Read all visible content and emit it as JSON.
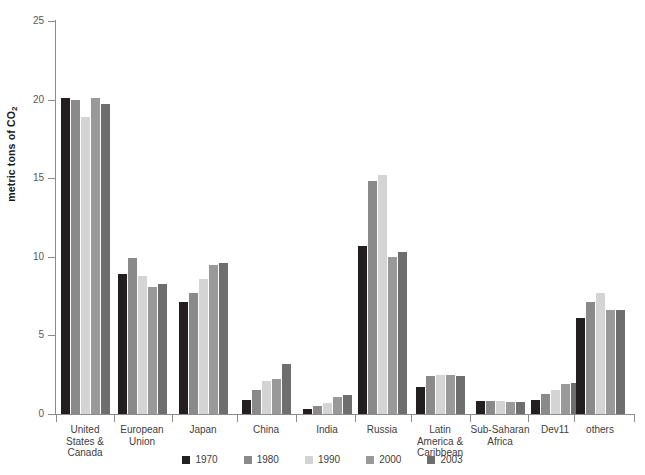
{
  "chart_data": {
    "type": "bar",
    "title": "",
    "subtitle": "",
    "xlabel": "",
    "ylabel": "metric tons of CO2",
    "ylabel_display": "metric tons of CO",
    "ylabel_subscript": "2",
    "ylim": [
      0,
      25
    ],
    "ytick_labels": [
      "0",
      "5",
      "10",
      "15",
      "20",
      "25"
    ],
    "ytick_values": [
      0,
      5,
      10,
      15,
      20,
      25
    ],
    "grid": false,
    "legend_position": "bottom",
    "categories": [
      "United States & Canada",
      "European Union",
      "Japan",
      "China",
      "India",
      "Russia",
      "Latin America & Caribbean",
      "Sub-Saharan Africa",
      "Dev11",
      "others"
    ],
    "category_label_lines": [
      [
        "United",
        "States &",
        "Canada"
      ],
      [
        "European",
        "Union"
      ],
      [
        "Japan"
      ],
      [
        "China"
      ],
      [
        "India"
      ],
      [
        "Russia"
      ],
      [
        "Latin",
        "America &",
        "Caribbean"
      ],
      [
        "Sub-Saharan",
        "Africa"
      ],
      [
        "Dev11"
      ],
      [
        "others"
      ]
    ],
    "series": [
      {
        "name": "1970",
        "color": "#231f20",
        "values": [
          20.1,
          8.9,
          7.1,
          0.9,
          0.35,
          10.7,
          1.7,
          0.85,
          0.9,
          6.1
        ]
      },
      {
        "name": "1980",
        "color": "#8a8a8a",
        "values": [
          20.0,
          9.9,
          7.7,
          1.5,
          0.5,
          14.8,
          2.4,
          0.85,
          1.3,
          7.1
        ]
      },
      {
        "name": "1990",
        "color": "#d4d4d4",
        "values": [
          18.9,
          8.8,
          8.6,
          2.1,
          0.7,
          15.2,
          2.5,
          0.8,
          1.5,
          7.7
        ]
      },
      {
        "name": "2000",
        "color": "#999999",
        "values": [
          20.1,
          8.1,
          9.5,
          2.2,
          1.1,
          10.0,
          2.5,
          0.75,
          1.9,
          6.6
        ]
      },
      {
        "name": "2003",
        "color": "#6e6e6e",
        "values": [
          19.7,
          8.3,
          9.6,
          3.2,
          1.2,
          10.3,
          2.45,
          0.75,
          2.0,
          6.6
        ]
      }
    ]
  },
  "legend": {
    "entries": [
      "1970",
      "1980",
      "1990",
      "2000",
      "2003"
    ]
  }
}
